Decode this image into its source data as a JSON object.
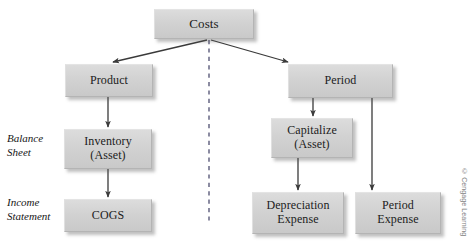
{
  "diagram": {
    "colors": {
      "node_fill": "#d4d4d4",
      "node_border": "#b4b4b4",
      "line": "#3a3a3a",
      "divider": "#6f6f8a",
      "text": "#1b1b1b",
      "credit_text": "#7e7e7e",
      "background": "#ffffff"
    },
    "nodes": [
      {
        "id": "costs",
        "label": "Costs",
        "x": 154,
        "y": 9,
        "w": 100,
        "h": 30,
        "font_size": 13
      },
      {
        "id": "product",
        "label": "Product",
        "x": 65,
        "y": 64,
        "w": 88,
        "h": 33,
        "font_size": 12
      },
      {
        "id": "period",
        "label": "Period",
        "x": 288,
        "y": 64,
        "w": 105,
        "h": 34,
        "font_size": 12
      },
      {
        "id": "inventory-asset",
        "label": "Inventory\n(Asset)",
        "x": 64,
        "y": 129,
        "w": 88,
        "h": 40,
        "font_size": 12
      },
      {
        "id": "capitalize-asset",
        "label": "Capitalize\n(Asset)",
        "x": 271,
        "y": 118,
        "w": 82,
        "h": 40,
        "font_size": 12
      },
      {
        "id": "cogs",
        "label": "COGS",
        "x": 64,
        "y": 199,
        "w": 88,
        "h": 33,
        "font_size": 12
      },
      {
        "id": "depreciation-expense",
        "label": "Depreciation\nExpense",
        "x": 252,
        "y": 192,
        "w": 92,
        "h": 42,
        "font_size": 12
      },
      {
        "id": "period-expense",
        "label": "Period\nExpense",
        "x": 355,
        "y": 192,
        "w": 86,
        "h": 42,
        "font_size": 12
      }
    ],
    "row_labels": [
      {
        "id": "balance-sheet",
        "label": "Balance\nSheet",
        "x": 7,
        "y": 131
      },
      {
        "id": "income-statement",
        "label": "Income\nStatement",
        "x": 7,
        "y": 195
      }
    ],
    "edges": [
      {
        "id": "costs-to-product",
        "from": "costs",
        "to": "product",
        "style": "solid-arrow"
      },
      {
        "id": "costs-to-period",
        "from": "costs",
        "to": "period",
        "style": "solid-arrow"
      },
      {
        "id": "product-to-inventory",
        "from": "product",
        "to": "inventory-asset",
        "style": "solid-arrow"
      },
      {
        "id": "inventory-to-cogs",
        "from": "inventory-asset",
        "to": "cogs",
        "style": "solid-arrow"
      },
      {
        "id": "period-to-capitalize",
        "from": "period",
        "to": "capitalize-asset",
        "style": "solid-arrow"
      },
      {
        "id": "capitalize-to-depreciation",
        "from": "capitalize-asset",
        "to": "depreciation-expense",
        "style": "solid-arrow"
      },
      {
        "id": "period-to-period-expense",
        "from": "period",
        "to": "period-expense",
        "style": "solid-arrow"
      }
    ],
    "divider": {
      "id": "vertical-dashed-divider",
      "x": 209,
      "y_start": 40,
      "y_end": 223
    },
    "credit": "© Cengage Learning"
  }
}
